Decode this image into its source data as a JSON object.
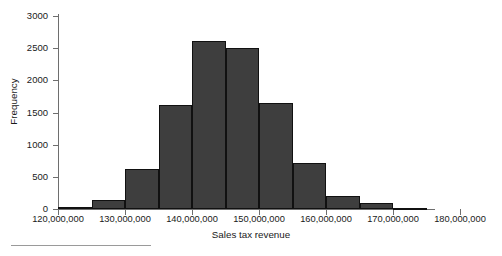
{
  "chart_data": {
    "type": "bar",
    "title": "",
    "subtitle": "",
    "xlabel": "Sales tax revenue",
    "ylabel": "Frequency",
    "grid": false,
    "legend": false,
    "legend_position": "none",
    "bar_fill_color": "#3e3e3e",
    "bar_edge_color": "#111111",
    "axis_color": "#6e6e6e",
    "xlim": [
      120000000,
      180000000
    ],
    "ylim": [
      0,
      3000
    ],
    "bin_width": 5000000,
    "xticks": [
      120000000,
      130000000,
      140000000,
      150000000,
      160000000,
      170000000,
      180000000
    ],
    "xtick_labels": [
      "120,000,000",
      "130,000,000",
      "140,000,000",
      "150,000,000",
      "160,000,000",
      "170,000,000",
      "180,000,000"
    ],
    "yticks": [
      0,
      500,
      1000,
      1500,
      2000,
      2500,
      3000
    ],
    "ytick_labels": [
      "0",
      "500",
      "1000",
      "1500",
      "2000",
      "2500",
      "3000"
    ],
    "bins": [
      {
        "x0": 120000000,
        "x1": 125000000,
        "value": 30
      },
      {
        "x0": 125000000,
        "x1": 130000000,
        "value": 140
      },
      {
        "x0": 130000000,
        "x1": 135000000,
        "value": 620
      },
      {
        "x0": 135000000,
        "x1": 140000000,
        "value": 1610
      },
      {
        "x0": 140000000,
        "x1": 145000000,
        "value": 2610
      },
      {
        "x0": 145000000,
        "x1": 150000000,
        "value": 2510
      },
      {
        "x0": 150000000,
        "x1": 155000000,
        "value": 1640
      },
      {
        "x0": 155000000,
        "x1": 160000000,
        "value": 710
      },
      {
        "x0": 160000000,
        "x1": 165000000,
        "value": 200
      },
      {
        "x0": 165000000,
        "x1": 170000000,
        "value": 90
      },
      {
        "x0": 170000000,
        "x1": 175000000,
        "value": 20
      }
    ],
    "categories": [
      "120-125M",
      "125-130M",
      "130-135M",
      "135-140M",
      "140-145M",
      "145-150M",
      "150-155M",
      "155-160M",
      "160-165M",
      "165-170M",
      "170-175M"
    ],
    "values": [
      30,
      140,
      620,
      1610,
      2610,
      2510,
      1640,
      710,
      200,
      90,
      20
    ]
  }
}
